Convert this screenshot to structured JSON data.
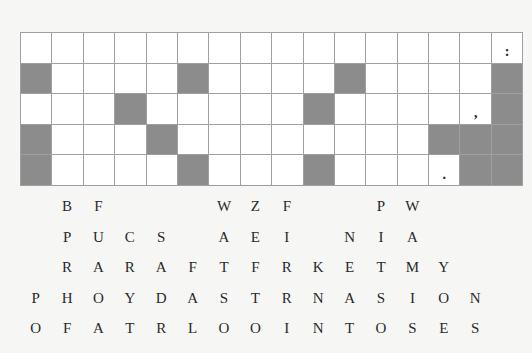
{
  "puzzle": {
    "type": "fallen-phrase",
    "columns": 16,
    "rows": 5,
    "grid": [
      [
        "",
        "",
        "",
        "",
        "",
        "",
        "",
        "",
        "",
        "",
        "",
        "",
        "",
        "",
        "",
        ":"
      ],
      [
        "#",
        "",
        "",
        "",
        "",
        "#",
        "",
        "",
        "",
        "",
        "#",
        "",
        "",
        "",
        "",
        "#"
      ],
      [
        "",
        "",
        "",
        "#",
        "",
        "",
        "",
        "",
        "",
        "#",
        "",
        "",
        "",
        "",
        ",",
        "#"
      ],
      [
        "#",
        "",
        "",
        "",
        "#",
        "",
        "",
        "",
        "",
        "",
        "",
        "",
        "",
        "#",
        "#",
        "#"
      ],
      [
        "#",
        "",
        "",
        "",
        "",
        "#",
        "",
        "",
        "",
        "#",
        "",
        "",
        "",
        ".",
        "#",
        "#"
      ]
    ],
    "letter_rows": [
      [
        "",
        "B",
        "F",
        "",
        "",
        "",
        "W",
        "Z",
        "F",
        "",
        "",
        "P",
        "W",
        "",
        "",
        ""
      ],
      [
        "",
        "P",
        "U",
        "C",
        "S",
        "",
        "A",
        "E",
        "I",
        "",
        "N",
        "I",
        "A",
        "",
        "",
        ""
      ],
      [
        "",
        "R",
        "A",
        "R",
        "A",
        "F",
        "T",
        "F",
        "R",
        "K",
        "E",
        "T",
        "M",
        "Y",
        "",
        ""
      ],
      [
        "P",
        "H",
        "O",
        "Y",
        "D",
        "A",
        "S",
        "T",
        "R",
        "N",
        "A",
        "S",
        "I",
        "O",
        "N",
        ""
      ],
      [
        "O",
        "F",
        "A",
        "T",
        "R",
        "L",
        "O",
        "O",
        "I",
        "N",
        "T",
        "O",
        "S",
        "E",
        "S",
        ""
      ]
    ]
  }
}
